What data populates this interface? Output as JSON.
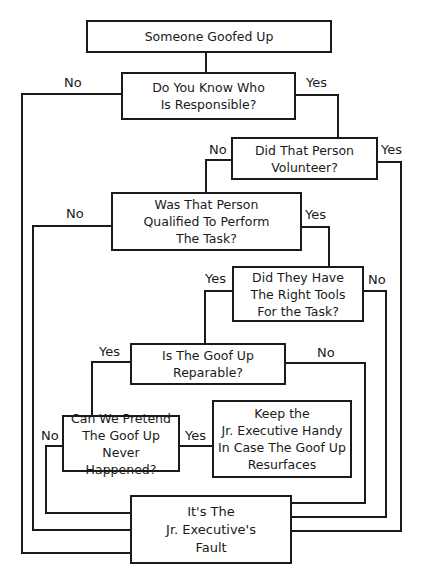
{
  "diagram": {
    "type": "flowchart",
    "nodes": {
      "start": "Someone Goofed Up",
      "know": "Do You Know Who\nIs Responsible?",
      "volunteer": "Did That Person\nVolunteer?",
      "qualified": "Was That Person\nQualified To Perform\nThe Task?",
      "tools": "Did They Have\nThe Right Tools\nFor the Task?",
      "reparable": "Is The Goof Up\nReparable?",
      "pretend": "Can We Pretend\nThe Goof Up\nNever Happened?",
      "keep": "Keep the\nJr. Executive Handy\nIn Case The Goof Up\nResurfaces",
      "fault": "It's The\nJr. Executive's\nFault"
    },
    "labels": {
      "know_no": "No",
      "know_yes": "Yes",
      "volunteer_no": "No",
      "volunteer_yes": "Yes",
      "qualified_no": "No",
      "qualified_yes": "Yes",
      "tools_yes": "Yes",
      "tools_no": "No",
      "reparable_yes": "Yes",
      "reparable_no": "No",
      "pretend_no": "No",
      "pretend_yes": "Yes"
    },
    "edges": [
      {
        "from": "start",
        "to": "know",
        "label": ""
      },
      {
        "from": "know",
        "to": "fault",
        "label": "No"
      },
      {
        "from": "know",
        "to": "volunteer",
        "label": "Yes"
      },
      {
        "from": "volunteer",
        "to": "qualified",
        "label": "No"
      },
      {
        "from": "volunteer",
        "to": "fault",
        "label": "Yes"
      },
      {
        "from": "qualified",
        "to": "fault",
        "label": "No"
      },
      {
        "from": "qualified",
        "to": "tools",
        "label": "Yes"
      },
      {
        "from": "tools",
        "to": "reparable",
        "label": "Yes"
      },
      {
        "from": "tools",
        "to": "fault",
        "label": "No"
      },
      {
        "from": "reparable",
        "to": "pretend",
        "label": "Yes"
      },
      {
        "from": "reparable",
        "to": "fault",
        "label": "No"
      },
      {
        "from": "pretend",
        "to": "keep",
        "label": "Yes"
      },
      {
        "from": "pretend",
        "to": "fault",
        "label": "No"
      }
    ]
  }
}
